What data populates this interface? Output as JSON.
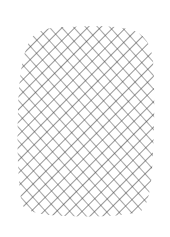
{
  "image": {
    "subject": "crosshatch pencil texture",
    "background_color": "#ffffff",
    "stroke_color": "#3c3c3c",
    "hatch_spacing_px": 9,
    "hatch_angles_deg": [
      45,
      -45
    ],
    "shape": "rounded-rectangle blob",
    "bounds": {
      "x": 16,
      "y": 24,
      "width": 140,
      "height": 192
    }
  }
}
